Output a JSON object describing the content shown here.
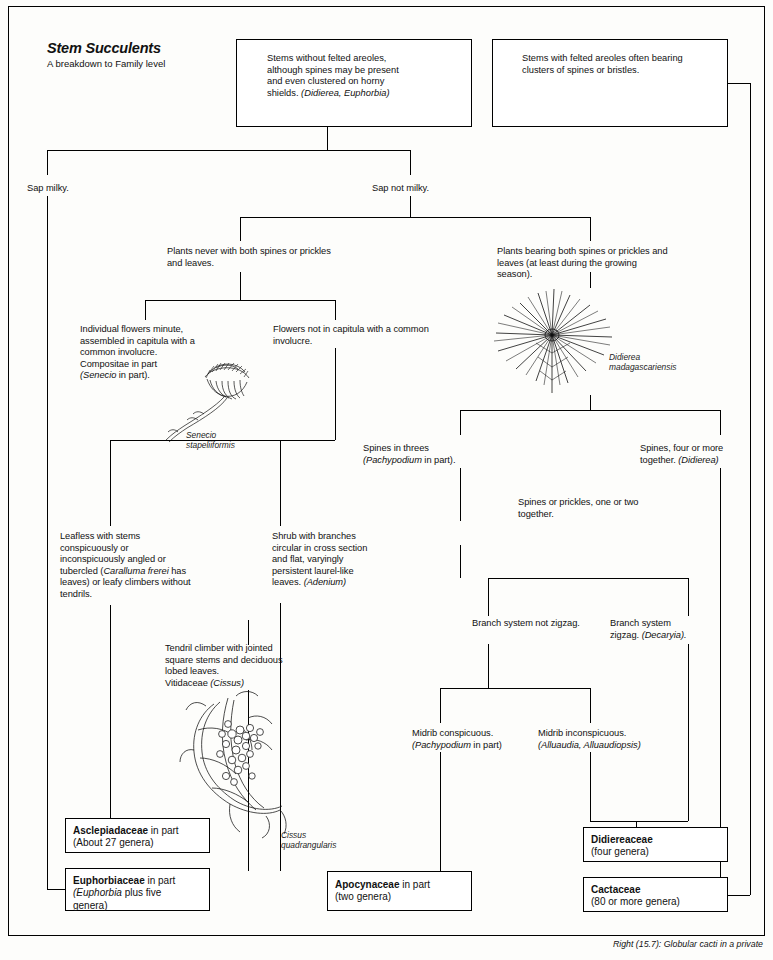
{
  "title": {
    "heading": "Stem Succulents",
    "subheading": "A breakdown to Family level"
  },
  "top_boxes": [
    {
      "id": "stems-without-areoles",
      "text": "Stems without felted areoles, although spines may be present and even clustered on horny shields. (Didierea, Euphorbia)"
    },
    {
      "id": "stems-with-areoles",
      "text": "Stems with felted areoles often bearing clusters of spines or bristles."
    }
  ],
  "branch_labels": {
    "sap_milky": "Sap milky.",
    "sap_not_milky": "Sap not milky.",
    "no_spines_and_leaves": "Plants never with both spines or prickles and leaves.",
    "both_spines_and_leaves": "Plants bearing both spines or prickles and leaves (at least during the growing season).",
    "capitula": "Individual flowers minute, assembled in capitula with a common involucre. Compositae in part (Senecio in part).",
    "not_capitula": "Flowers not in capitula with a common involucre.",
    "spines_in_threes": "Spines in threes (Pachypodium in part).",
    "spines_four_or_more": "Spines, four or more together. (Didierea)",
    "spines_one_or_two": "Spines or prickles, one or two together.",
    "leafless_stems": "Leafless with stems conspicuously or inconspicuously angled or tubercled (Caralluma frerei has leaves) or leafy climbers without tendrils.",
    "shrub_branches": "Shrub with branches circular in cross section and flat, varyingly persistent laurel-like leaves. (Adenium)",
    "tendril_climber": "Tendril climber with jointed square stems and deciduous lobed leaves. Vitidaceae (Cissus)",
    "branch_not_zigzag": "Branch system not zigzag.",
    "branch_zigzag": "Branch system zigzag. (Decaryia).",
    "midrib_conspicuous": "Midrib conspicuous. (Pachypodium in part)",
    "midrib_inconspicuous": "Midrib inconspicuous. (Alluaudia, Alluaudiopsis)"
  },
  "illustration_captions": {
    "senecio": "Senecio\nstapeliiformis",
    "didierea": "Didierea\nmadagascariensis",
    "cissus": "Cissus\nquadrangularis"
  },
  "family_boxes": [
    {
      "id": "asclepiadaceae",
      "name": "Asclepiadaceae",
      "qualifier": " in part",
      "detail": "(About 27 genera)"
    },
    {
      "id": "euphorbiaceae",
      "name": "Euphorbiaceae",
      "qualifier": " in part",
      "detail": "(Euphorbia plus five genera)"
    },
    {
      "id": "apocynaceae",
      "name": "Apocynaceae",
      "qualifier": " in part",
      "detail": "(two genera)"
    },
    {
      "id": "didiereaceae",
      "name": "Didiereaceae",
      "qualifier": "",
      "detail": "(four genera)"
    },
    {
      "id": "cactaceae",
      "name": "Cactaceae",
      "qualifier": "",
      "detail": "(80 or more genera)"
    }
  ],
  "bottom_caption": "Right (15.7): Globular cacti in a private"
}
